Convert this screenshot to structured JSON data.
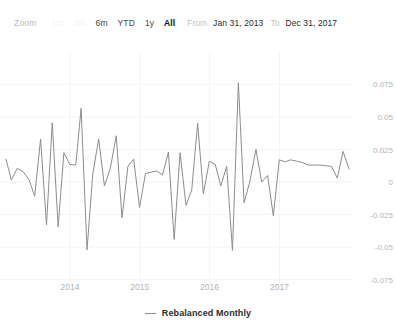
{
  "rangebar": {
    "zoom_label": "Zoom",
    "buttons": [
      {
        "label": "1m",
        "state": "ghost"
      },
      {
        "label": "3m",
        "state": "ghost"
      },
      {
        "label": "6m",
        "state": "normal"
      },
      {
        "label": "YTD",
        "state": "normal"
      },
      {
        "label": "1y",
        "state": "normal"
      },
      {
        "label": "All",
        "state": "selected"
      }
    ],
    "from_label": "From",
    "from_value": "Jan 31, 2013",
    "to_label": "To",
    "to_value": "Dec 31, 2017"
  },
  "legend": {
    "items": [
      {
        "label": "Rebalanced Monthly",
        "color": "#8d8d8d"
      }
    ]
  },
  "colors": {
    "line": "#8d8d8d",
    "grid": "#f4f4f4",
    "axis_text": "#b5b5b5",
    "accent": "#111111"
  },
  "chart_data": {
    "type": "line",
    "title": "",
    "subtitle": "",
    "xlabel": "",
    "ylabel": "",
    "grid": true,
    "legend_position": "bottom",
    "xlim": [
      "2013-01-31",
      "2017-12-31"
    ],
    "ylim": [
      -0.0875,
      0.0875
    ],
    "yticks": [
      0.075,
      0.05,
      0.025,
      0,
      -0.025,
      -0.05,
      -0.075
    ],
    "ytick_labels": [
      "0.075",
      "0.05",
      "0.025",
      "0",
      "-0.025",
      "-0.05",
      "-0.075"
    ],
    "xticks": [
      "2014",
      "2015",
      "2016",
      "2017"
    ],
    "xtick_labels": [
      "2014",
      "2015",
      "2016",
      "2017"
    ],
    "series": [
      {
        "name": "Rebalanced Monthly",
        "color": "#8d8d8d",
        "x": [
          "2013-01-31",
          "2013-02-28",
          "2013-03-31",
          "2013-04-30",
          "2013-05-31",
          "2013-06-30",
          "2013-07-31",
          "2013-08-31",
          "2013-09-30",
          "2013-10-31",
          "2013-11-30",
          "2013-12-31",
          "2014-01-31",
          "2014-02-28",
          "2014-03-31",
          "2014-04-30",
          "2014-05-31",
          "2014-06-30",
          "2014-07-31",
          "2014-08-31",
          "2014-09-30",
          "2014-10-31",
          "2014-11-30",
          "2014-12-31",
          "2015-01-31",
          "2015-02-28",
          "2015-03-31",
          "2015-04-30",
          "2015-05-31",
          "2015-06-30",
          "2015-07-31",
          "2015-08-31",
          "2015-09-30",
          "2015-10-31",
          "2015-11-30",
          "2015-12-31",
          "2016-01-31",
          "2016-02-29",
          "2016-03-31",
          "2016-04-30",
          "2016-05-31",
          "2016-06-30",
          "2016-07-31",
          "2016-08-31",
          "2016-09-30",
          "2016-10-31",
          "2016-11-30",
          "2016-12-31",
          "2017-01-31",
          "2017-02-28",
          "2017-03-31",
          "2017-04-30",
          "2017-05-31",
          "2017-06-30",
          "2017-07-31",
          "2017-08-31",
          "2017-09-30",
          "2017-10-31",
          "2017-11-30",
          "2017-12-31"
        ],
        "values": [
          0.0175,
          0.0015,
          0.0105,
          0.008,
          0.002,
          -0.011,
          0.033,
          -0.033,
          0.0455,
          -0.0345,
          0.0225,
          0.0135,
          0.013,
          0.0565,
          -0.052,
          0.006,
          0.033,
          -0.003,
          0.0105,
          0.0355,
          -0.0275,
          0.012,
          0.0175,
          -0.0195,
          0.0065,
          0.0075,
          0.0085,
          0.0055,
          0.023,
          -0.044,
          0.0225,
          -0.018,
          -0.006,
          0.045,
          -0.009,
          0.016,
          0.0135,
          -0.003,
          0.012,
          -0.0525,
          0.076,
          -0.016,
          0.001,
          0.025,
          0.0,
          0.005,
          -0.026,
          0.017,
          0.0155,
          0.017,
          0.016,
          0.015,
          0.013,
          0.013,
          0.013,
          0.0125,
          0.012,
          0.003,
          0.0235,
          0.01
        ]
      }
    ]
  }
}
